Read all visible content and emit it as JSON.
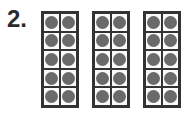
{
  "problem_number": "2.",
  "frames": [
    {
      "rows": 5,
      "cols": 2,
      "filled": 10
    },
    {
      "rows": 5,
      "cols": 2,
      "filled": 10
    },
    {
      "rows": 5,
      "cols": 2,
      "filled": 10
    }
  ],
  "colors": {
    "dot": "#6a6a6a",
    "border": "#333333"
  }
}
